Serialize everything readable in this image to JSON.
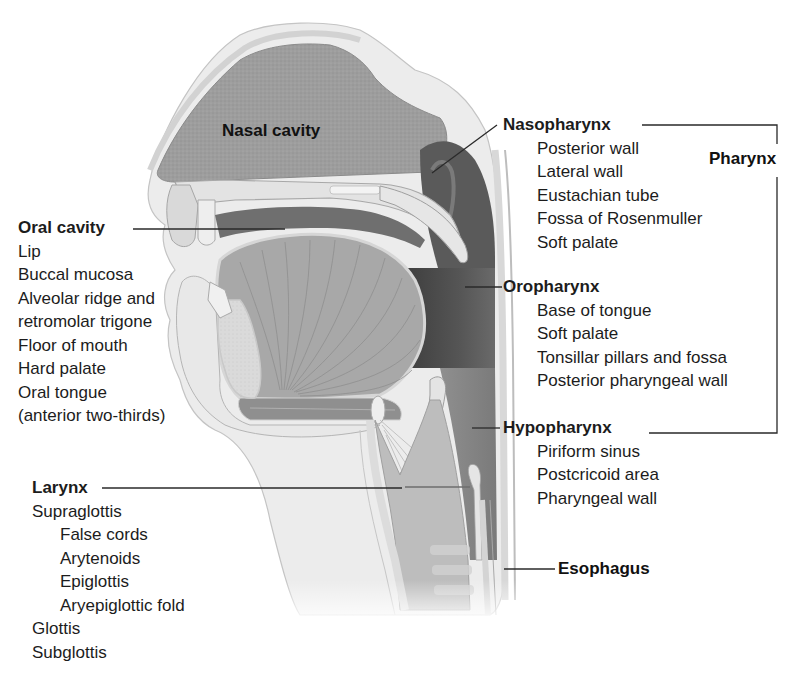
{
  "diagram": {
    "title_regions": {
      "nasal_cavity": "Nasal cavity",
      "pharynx": "Pharynx",
      "esophagus": "Esophagus"
    },
    "oral_cavity": {
      "heading": "Oral cavity",
      "items": [
        "Lip",
        "Buccal mucosa",
        "Alveolar ridge and",
        "retromolar trigone",
        "Floor of mouth",
        "Hard palate",
        "Oral tongue",
        "(anterior two-thirds)"
      ]
    },
    "larynx": {
      "heading": "Larynx",
      "items": [
        {
          "label": "Supraglottis",
          "indent": 0
        },
        {
          "label": "False cords",
          "indent": 1
        },
        {
          "label": "Arytenoids",
          "indent": 1
        },
        {
          "label": "Epiglottis",
          "indent": 1
        },
        {
          "label": "Aryepiglottic fold",
          "indent": 1
        },
        {
          "label": "Glottis",
          "indent": 0
        },
        {
          "label": "Subglottis",
          "indent": 0
        }
      ]
    },
    "nasopharynx": {
      "heading": "Nasopharynx",
      "items": [
        "Posterior wall",
        "Lateral wall",
        "Eustachian tube",
        "Fossa of Rosenmuller",
        "Soft palate"
      ]
    },
    "oropharynx": {
      "heading": "Oropharynx",
      "items": [
        "Base of tongue",
        "Soft palate",
        "Tonsillar pillars and fossa",
        "Posterior pharyngeal wall"
      ]
    },
    "hypopharynx": {
      "heading": "Hypopharynx",
      "items": [
        "Piriform sinus",
        "Postcricoid area",
        "Pharyngeal wall"
      ]
    },
    "colors": {
      "text": "#111111",
      "leader_line": "#2a2a2a",
      "tissue_light": "#e6e6e6",
      "tissue_mid": "#b5b5b5",
      "tissue_dark": "#5e5e5e",
      "pharynx_dark": "#4a4a4a"
    }
  }
}
